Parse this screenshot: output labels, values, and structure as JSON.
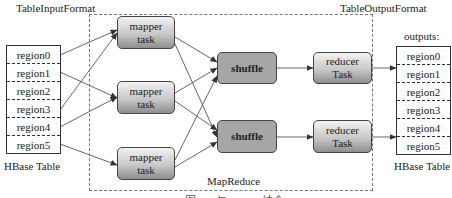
{
  "diagram": {
    "input_format_label": "TableInputFormat",
    "output_format_label": "TableOutputFormat",
    "mapreduce_label": "MapReduce",
    "caption": "图 6-3  与 HBase 结合 MapReduce",
    "input_table": {
      "name": "HBase Table",
      "regions": [
        "region0",
        "region1",
        "region2",
        "region3",
        "region4",
        "region5"
      ]
    },
    "output_table": {
      "header": "outputs:",
      "name": "HBase Table",
      "regions": [
        "region0",
        "region1",
        "region2",
        "region3",
        "region4",
        "region5"
      ]
    },
    "mappers": [
      {
        "line1": "mapper",
        "line2": "task"
      },
      {
        "line1": "mapper",
        "line2": "task"
      },
      {
        "line1": "mapper",
        "line2": "task"
      }
    ],
    "shuffles": [
      {
        "label": "shuffle"
      },
      {
        "label": "shuffle"
      }
    ],
    "reducers": [
      {
        "line1": "reducer",
        "line2": "Task"
      },
      {
        "line1": "reducer",
        "line2": "Task"
      }
    ],
    "edges": [
      {
        "from": "input.region0",
        "to": "mapper0"
      },
      {
        "from": "input.region1",
        "to": "mapper1"
      },
      {
        "from": "input.region3",
        "to": "mapper0"
      },
      {
        "from": "input.region4",
        "to": "mapper1"
      },
      {
        "from": "input.region5",
        "to": "mapper2"
      },
      {
        "from": "mapper0",
        "to": "shuffle0"
      },
      {
        "from": "mapper0",
        "to": "shuffle1"
      },
      {
        "from": "mapper1",
        "to": "shuffle0"
      },
      {
        "from": "mapper1",
        "to": "shuffle1"
      },
      {
        "from": "mapper2",
        "to": "shuffle0"
      },
      {
        "from": "mapper2",
        "to": "shuffle1"
      },
      {
        "from": "shuffle0",
        "to": "reducer0"
      },
      {
        "from": "shuffle1",
        "to": "reducer1"
      },
      {
        "from": "reducer0",
        "to": "output.region1"
      },
      {
        "from": "reducer1",
        "to": "output.region5"
      }
    ],
    "colors": {
      "shuffle_fill": "#a6a6a6",
      "task_gradient_top": "#f2f2f2",
      "task_gradient_bottom": "#8e8e8e",
      "line": "#444444"
    }
  }
}
